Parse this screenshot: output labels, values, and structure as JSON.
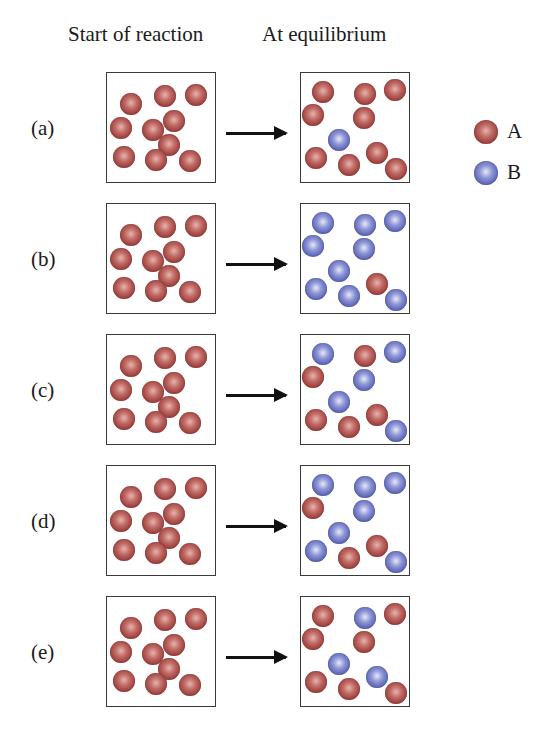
{
  "headers": {
    "start": "Start of reaction",
    "equilibrium": "At equilibrium"
  },
  "legend": [
    {
      "species": "A",
      "label": "A",
      "color": "#a8443f"
    },
    {
      "species": "B",
      "label": "B",
      "color": "#5f69b8"
    }
  ],
  "colors": {
    "A": "#a8443f",
    "B": "#5f69b8",
    "box_border": "#3a3a3a",
    "arrow": "#111111"
  },
  "rows": [
    {
      "label": "(a)",
      "start": {
        "A": 10,
        "B": 0
      },
      "equilibrium": {
        "A": 9,
        "B": 1
      },
      "eq_pattern": [
        "A",
        "A",
        "A",
        "A",
        "A",
        "B",
        "A",
        "A",
        "A",
        "A"
      ]
    },
    {
      "label": "(b)",
      "start": {
        "A": 10,
        "B": 0
      },
      "equilibrium": {
        "A": 1,
        "B": 9
      },
      "eq_pattern": [
        "B",
        "B",
        "B",
        "B",
        "B",
        "B",
        "B",
        "B",
        "A",
        "B"
      ]
    },
    {
      "label": "(c)",
      "start": {
        "A": 10,
        "B": 0
      },
      "equilibrium": {
        "A": 5,
        "B": 5
      },
      "eq_pattern": [
        "B",
        "A",
        "B",
        "A",
        "B",
        "B",
        "A",
        "A",
        "A",
        "B"
      ]
    },
    {
      "label": "(d)",
      "start": {
        "A": 10,
        "B": 0
      },
      "equilibrium": {
        "A": 3,
        "B": 7
      },
      "eq_pattern": [
        "B",
        "B",
        "B",
        "A",
        "B",
        "B",
        "B",
        "A",
        "A",
        "B"
      ]
    },
    {
      "label": "(e)",
      "start": {
        "A": 10,
        "B": 0
      },
      "equilibrium": {
        "A": 7,
        "B": 3
      },
      "eq_pattern": [
        "A",
        "B",
        "A",
        "A",
        "A",
        "B",
        "A",
        "A",
        "B",
        "A"
      ]
    }
  ]
}
